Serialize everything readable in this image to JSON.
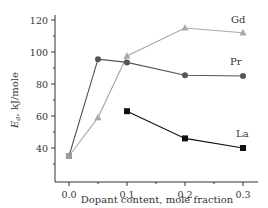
{
  "chart_data": {
    "type": "line",
    "title": "",
    "xlabel": "Dopant content, mole fraction",
    "ylabel": "E_a, kJ/mole",
    "ylabel_parts": {
      "symbol": "E",
      "subscript": "a",
      "rest": ", kJ/mole"
    },
    "xlim": [
      -0.025,
      0.33
    ],
    "ylim": [
      28,
      122
    ],
    "x_ticks": [
      0.0,
      0.1,
      0.2,
      0.3
    ],
    "x_tick_labels": [
      "0.0",
      "0.1",
      "0.2",
      "0.3"
    ],
    "x_minor_ticks": [
      0.05,
      0.15,
      0.25
    ],
    "y_ticks": [
      40,
      60,
      80,
      100,
      120
    ],
    "y_tick_labels": [
      "40",
      "60",
      "80",
      "100",
      "120"
    ],
    "y_minor_ticks": [
      30,
      50,
      70,
      90,
      110
    ],
    "grid": false,
    "legend": "inline labels at series ends",
    "series": [
      {
        "name": "Gd",
        "marker": "triangle",
        "color": "#a8a8a8",
        "x": [
          0.0,
          0.05,
          0.1,
          0.2,
          0.3
        ],
        "values": [
          35,
          59,
          97.5,
          115,
          112
        ]
      },
      {
        "name": "Pr",
        "marker": "circle",
        "color": "#555555",
        "x": [
          0.0,
          0.05,
          0.1,
          0.2,
          0.3
        ],
        "values": [
          35,
          95.5,
          93.5,
          85.5,
          85
        ]
      },
      {
        "name": "La",
        "marker": "square",
        "color": "#111111",
        "x": [
          0.1,
          0.2,
          0.3
        ],
        "values": [
          63,
          46,
          40
        ]
      }
    ],
    "shared_origin_marker": {
      "x": 0.0,
      "value": 35,
      "marker": "square",
      "color": "#9a9a9a"
    }
  }
}
